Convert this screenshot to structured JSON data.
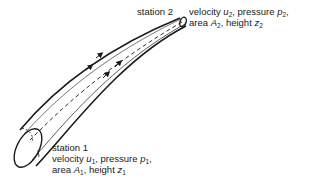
{
  "diagram": {
    "type": "stream-tube",
    "stroke_color": "#1a1a1a",
    "station2": {
      "title": "station 2",
      "line1": {
        "a": "velocity ",
        "var1": "u",
        "sub1": "2",
        "b": ", pressure ",
        "var2": "p",
        "sub2": "2",
        "c": ","
      },
      "line2": {
        "a": "area ",
        "var1": "A",
        "sub1": "2",
        "b": ", height ",
        "var2": "z",
        "sub2": "2"
      }
    },
    "station1": {
      "title": "station 1",
      "line1": {
        "a": "velocity ",
        "var1": "u",
        "sub1": "1",
        "b": ", pressure ",
        "var2": "p",
        "sub2": "1",
        "c": ","
      },
      "line2": {
        "a": "area ",
        "var1": "A",
        "sub1": "1",
        "b": ", height ",
        "var2": "z",
        "sub2": "1"
      }
    }
  }
}
